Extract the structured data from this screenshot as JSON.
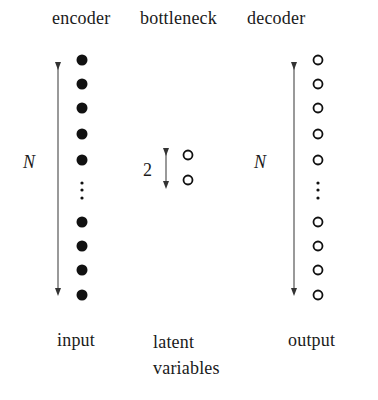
{
  "header": {
    "encoder": "encoder",
    "bottleneck": "bottleneck",
    "decoder": "decoder"
  },
  "encoder": {
    "size_label": "N",
    "node_style": "filled",
    "visible_nodes_top": 5,
    "visible_nodes_bottom": 4,
    "ellipsis": "⋮"
  },
  "bottleneck": {
    "size_label": "2",
    "node_style": "hollow",
    "nodes": 2
  },
  "decoder": {
    "size_label": "N",
    "node_style": "hollow",
    "visible_nodes_top": 5,
    "visible_nodes_bottom": 4,
    "ellipsis": "⋮"
  },
  "footer": {
    "input": "input",
    "latent_line1": "latent",
    "latent_line2": "variables",
    "output": "output"
  },
  "colors": {
    "ink": "#1a1a1a",
    "arrow": "#555555",
    "background": "#ffffff"
  }
}
